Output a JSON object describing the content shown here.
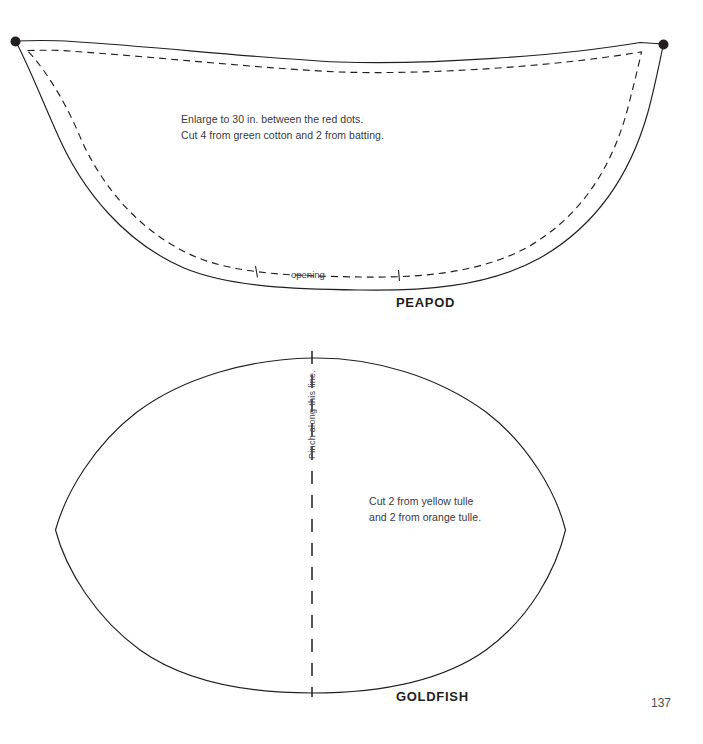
{
  "page": {
    "number": "137",
    "background_color": "#ffffff",
    "ink_color": "#231f20"
  },
  "pieces": [
    {
      "name": "peapod",
      "label": "PEAPOD",
      "notes": [
        "Enlarge to 30 in. between the red dots.",
        "Cut 4 from green cotton and 2 from batting."
      ],
      "markings": [
        {
          "name": "opening",
          "label": "opening"
        },
        {
          "name": "red-dot-left",
          "label": ""
        },
        {
          "name": "red-dot-right",
          "label": ""
        }
      ]
    },
    {
      "name": "goldfish",
      "label": "GOLDFISH",
      "notes": [
        "Cut 2 from yellow tulle",
        "and 2 from orange tulle."
      ],
      "markings": [
        {
          "name": "pinch-line",
          "label": "Pinch along this line."
        }
      ]
    }
  ]
}
